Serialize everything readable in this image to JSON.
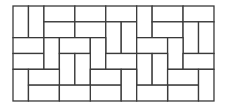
{
  "diagram": {
    "type": "tiling-pattern",
    "grid": {
      "cols": 13,
      "rows": 6
    },
    "origin": {
      "x": 13,
      "y": 6
    },
    "cell": {
      "w": 15.46,
      "h": 15.83
    },
    "stroke_color": "#3a3a3a",
    "fill_color": "#ffffff",
    "stroke_width": 1.3,
    "tiles": [
      {
        "c": 0,
        "r": 0,
        "w": 1,
        "h": 2
      },
      {
        "c": 1,
        "r": 0,
        "w": 1,
        "h": 2
      },
      {
        "c": 2,
        "r": 0,
        "w": 2,
        "h": 1
      },
      {
        "c": 2,
        "r": 1,
        "w": 2,
        "h": 1
      },
      {
        "c": 4,
        "r": 0,
        "w": 2,
        "h": 1
      },
      {
        "c": 4,
        "r": 1,
        "w": 2,
        "h": 1
      },
      {
        "c": 6,
        "r": 0,
        "w": 2,
        "h": 1
      },
      {
        "c": 6,
        "r": 1,
        "w": 1,
        "h": 2
      },
      {
        "c": 7,
        "r": 1,
        "w": 1,
        "h": 2
      },
      {
        "c": 8,
        "r": 0,
        "w": 1,
        "h": 2
      },
      {
        "c": 9,
        "r": 0,
        "w": 2,
        "h": 1
      },
      {
        "c": 9,
        "r": 1,
        "w": 2,
        "h": 1
      },
      {
        "c": 11,
        "r": 0,
        "w": 2,
        "h": 1
      },
      {
        "c": 11,
        "r": 1,
        "w": 1,
        "h": 2
      },
      {
        "c": 12,
        "r": 1,
        "w": 1,
        "h": 2
      },
      {
        "c": 0,
        "r": 2,
        "w": 2,
        "h": 1
      },
      {
        "c": 0,
        "r": 3,
        "w": 2,
        "h": 1
      },
      {
        "c": 2,
        "r": 2,
        "w": 1,
        "h": 2
      },
      {
        "c": 3,
        "r": 2,
        "w": 2,
        "h": 1
      },
      {
        "c": 5,
        "r": 2,
        "w": 1,
        "h": 2
      },
      {
        "c": 8,
        "r": 2,
        "w": 2,
        "h": 1
      },
      {
        "c": 10,
        "r": 2,
        "w": 1,
        "h": 2
      },
      {
        "c": 3,
        "r": 3,
        "w": 1,
        "h": 2
      },
      {
        "c": 4,
        "r": 3,
        "w": 1,
        "h": 2
      },
      {
        "c": 6,
        "r": 3,
        "w": 2,
        "h": 1
      },
      {
        "c": 8,
        "r": 3,
        "w": 1,
        "h": 2
      },
      {
        "c": 9,
        "r": 3,
        "w": 1,
        "h": 2
      },
      {
        "c": 11,
        "r": 3,
        "w": 2,
        "h": 1
      },
      {
        "c": 0,
        "r": 4,
        "w": 1,
        "h": 2
      },
      {
        "c": 1,
        "r": 4,
        "w": 2,
        "h": 1
      },
      {
        "c": 1,
        "r": 5,
        "w": 2,
        "h": 1
      },
      {
        "c": 5,
        "r": 4,
        "w": 2,
        "h": 1
      },
      {
        "c": 5,
        "r": 5,
        "w": 2,
        "h": 1
      },
      {
        "c": 7,
        "r": 4,
        "w": 1,
        "h": 2
      },
      {
        "c": 10,
        "r": 4,
        "w": 2,
        "h": 1
      },
      {
        "c": 10,
        "r": 5,
        "w": 2,
        "h": 1
      },
      {
        "c": 12,
        "r": 4,
        "w": 1,
        "h": 2
      },
      {
        "c": 3,
        "r": 5,
        "w": 2,
        "h": 1
      },
      {
        "c": 8,
        "r": 5,
        "w": 2,
        "h": 1
      }
    ]
  }
}
